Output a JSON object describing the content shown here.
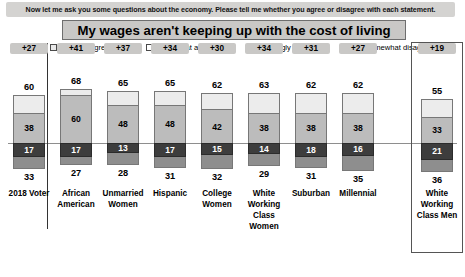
{
  "banner": {
    "text": "Now let me ask you some questions about the economy. Please tell me whether you agree or disagree with each statement."
  },
  "title": "My wages aren't keeping up with the cost of living",
  "legend": [
    {
      "label": "Strongly agree",
      "marker": "square-light-outline",
      "color": "#ececec"
    },
    {
      "label": "Somewhat agree",
      "marker": "square-white-outline",
      "color": "#ffffff"
    },
    {
      "label": "Strongly disagree",
      "marker": "square-dark-filled",
      "color": "#3d3d3d"
    },
    {
      "label": "Somewhat disagree",
      "marker": "square-gray-filled",
      "color": "#8e8e8e"
    }
  ],
  "chart_data": {
    "type": "bar",
    "title": "My wages aren't keeping up with the cost of living",
    "subtitle": "Now let me ask you some questions about the economy. Please tell me whether you agree or disagree with each statement.",
    "xlabel": "",
    "ylabel": "",
    "stacked": true,
    "orientation": "vertical",
    "grid": false,
    "legend_position": "top",
    "zero_axis": true,
    "categories": [
      "2018 Voter",
      "African American",
      "Unmarried Women",
      "Hispanic",
      "College Women",
      "White Working Class Women",
      "Suburban",
      "Millennial",
      "White Working Class Men"
    ],
    "series": [
      {
        "name": "Strongly agree",
        "values": [
          22,
          8,
          17,
          17,
          20,
          25,
          24,
          24,
          22
        ]
      },
      {
        "name": "Somewhat agree",
        "values": [
          38,
          60,
          48,
          48,
          42,
          38,
          38,
          38,
          33
        ]
      },
      {
        "name": "Strongly disagree",
        "values": [
          17,
          17,
          13,
          17,
          15,
          14,
          18,
          16,
          21
        ]
      },
      {
        "name": "Somewhat disagree",
        "values": [
          16,
          10,
          15,
          14,
          17,
          15,
          13,
          19,
          15
        ]
      }
    ],
    "total_agree": [
      60,
      68,
      65,
      65,
      62,
      63,
      62,
      62,
      55
    ],
    "total_disagree": [
      33,
      27,
      28,
      31,
      32,
      29,
      31,
      35,
      36
    ],
    "net": [
      "+27",
      "+41",
      "+37",
      "+34",
      "+30",
      "+34",
      "+31",
      "+27",
      "+19"
    ],
    "labeled_values": {
      "somewhat_agree": [
        38,
        60,
        48,
        48,
        42,
        38,
        38,
        38,
        33
      ],
      "strongly_disagree": [
        17,
        17,
        13,
        17,
        15,
        14,
        18,
        16,
        21
      ]
    },
    "highlighted_category": "White Working Class Men",
    "separator_after_category": "2018 Voter"
  },
  "columns": [
    {
      "net": "+27",
      "top": "60",
      "bottom": "33",
      "sa": 22,
      "wa": 38,
      "sd": 17,
      "wd": 16,
      "wa_label": "38",
      "sd_label": "17",
      "cat": "2018 Voter"
    },
    {
      "net": "+41",
      "top": "68",
      "bottom": "27",
      "sa": 8,
      "wa": 60,
      "sd": 17,
      "wd": 10,
      "wa_label": "60",
      "sd_label": "17",
      "cat": "African American"
    },
    {
      "net": "+37",
      "top": "65",
      "bottom": "28",
      "sa": 17,
      "wa": 48,
      "sd": 13,
      "wd": 15,
      "wa_label": "48",
      "sd_label": "13",
      "cat": "Unmarried Women"
    },
    {
      "net": "+34",
      "top": "65",
      "bottom": "31",
      "sa": 17,
      "wa": 48,
      "sd": 17,
      "wd": 14,
      "wa_label": "48",
      "sd_label": "17",
      "cat": "Hispanic"
    },
    {
      "net": "+30",
      "top": "62",
      "bottom": "32",
      "sa": 20,
      "wa": 42,
      "sd": 15,
      "wd": 17,
      "wa_label": "42",
      "sd_label": "15",
      "cat": "College Women"
    },
    {
      "net": "+34",
      "top": "63",
      "bottom": "29",
      "sa": 25,
      "wa": 38,
      "sd": 14,
      "wd": 15,
      "wa_label": "38",
      "sd_label": "14",
      "cat": "White Working Class Women"
    },
    {
      "net": "+31",
      "top": "62",
      "bottom": "31",
      "sa": 24,
      "wa": 38,
      "sd": 18,
      "wd": 13,
      "wa_label": "38",
      "sd_label": "18",
      "cat": "Suburban"
    },
    {
      "net": "+27",
      "top": "62",
      "bottom": "35",
      "sa": 24,
      "wa": 38,
      "sd": 16,
      "wd": 19,
      "wa_label": "38",
      "sd_label": "16",
      "cat": "Millennial"
    },
    {
      "net": "+19",
      "top": "55",
      "bottom": "36",
      "sa": 22,
      "wa": 33,
      "sd": 21,
      "wd": 15,
      "wa_label": "33",
      "sd_label": "21",
      "cat": "White Working Class Men"
    }
  ]
}
